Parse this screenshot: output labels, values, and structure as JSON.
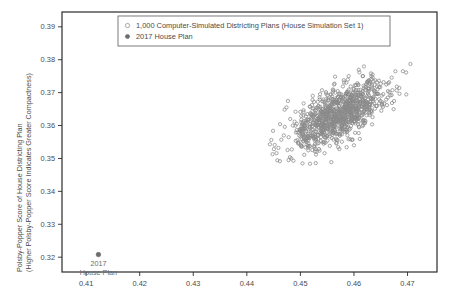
{
  "chart_data": {
    "type": "scatter",
    "title": "",
    "xlabel": "",
    "ylabel": "Polsby-Popper Score of House Districting Plan\n(Higher Polsby-Popper Score Indicates Greater Compactness)",
    "ylabel_line1": "Polsby-Popper Score of House Districting Plan",
    "ylabel_line2": "(Higher Polsby-Popper Score Indicates Greater Compactness)",
    "xlim": [
      0.4055,
      0.4755
    ],
    "ylim": [
      0.3155,
      0.3945
    ],
    "grid": false,
    "legend_position": "top-center",
    "xticks": [
      0.41,
      0.42,
      0.43,
      0.44,
      0.45,
      0.46,
      0.47
    ],
    "xtick_labels": [
      "0.41",
      "0.42",
      "0.43",
      "0.44",
      "0.45",
      "0.46",
      "0.47"
    ],
    "yticks": [
      0.32,
      0.33,
      0.34,
      0.35,
      0.36,
      0.37,
      0.38,
      0.39
    ],
    "ytick_labels": [
      "0.32",
      "0.33",
      "0.34",
      "0.35",
      "0.36",
      "0.37",
      "0.38",
      "0.39"
    ],
    "series": [
      {
        "name": "1,000 Computer-Simulated Districting Plans (House Simulation Set 1)",
        "marker": "open-circle",
        "color": "#8a8a8a",
        "count": 1000,
        "x_center": 0.4572,
        "y_center": 0.3632,
        "x_range": [
          0.4435,
          0.4742
        ],
        "y_range": [
          0.348,
          0.3842
        ],
        "correlation": 0.62
      },
      {
        "name": "2017 House Plan",
        "marker": "filled-circle",
        "color": "#6d6d6d",
        "count": 1,
        "points": [
          [
            0.4123,
            0.3208
          ]
        ]
      }
    ],
    "annotations": [
      {
        "name": "2017-house-plan-annotation",
        "line1": "2017",
        "line2": "House Plan",
        "x": 0.4123,
        "y": 0.3208
      }
    ]
  },
  "legend": {
    "entries": [
      {
        "label": "1,000 Computer-Simulated Districting Plans (House Simulation Set 1)",
        "marker": "open-circle"
      },
      {
        "label": "2017 House Plan",
        "marker": "filled-circle"
      }
    ]
  },
  "colors": {
    "frame": "#2b2b2b",
    "simulated_marker": "#8a8a8a",
    "observed_marker": "#6d6d6d",
    "text": "#4a4a4a",
    "annotation_text": "#6b6b6b",
    "background": "#ffffff"
  }
}
